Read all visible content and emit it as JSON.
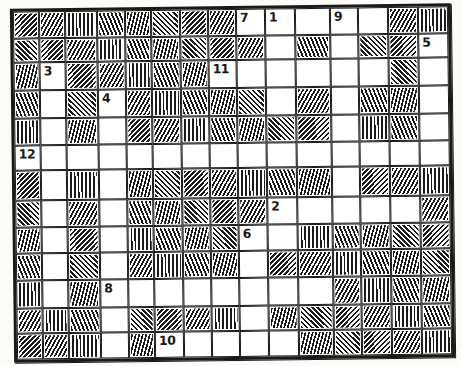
{
  "figure": {
    "type": "crossword-grid",
    "style": "hand-drawn-ink-sketch",
    "rows": 13,
    "cols": 15
  },
  "colors": {
    "ink": "#1a1a1a",
    "paper": "#ffffff"
  },
  "grid": {
    "pattern": [
      "########.....##",
      "#########.#.##.",
      "#.#####......#.",
      "#.#.#####.#.##.",
      "#.#.#######.##.",
      "...............",
      "#.#.#######.###",
      "#.#.#####.....#",
      "#.#.####..#####",
      "#.#.####.######",
      "#.#........####",
      "###.####.######",
      "###.#.....#####"
    ],
    "numbers": [
      {
        "label": "7",
        "row": 1,
        "col": 9
      },
      {
        "label": "1",
        "row": 1,
        "col": 10
      },
      {
        "label": "9",
        "row": 1,
        "col": 12
      },
      {
        "label": "5",
        "row": 2,
        "col": 15
      },
      {
        "label": "3",
        "row": 3,
        "col": 2
      },
      {
        "label": "11",
        "row": 3,
        "col": 8
      },
      {
        "label": "4",
        "row": 4,
        "col": 4
      },
      {
        "label": "12",
        "row": 6,
        "col": 1
      },
      {
        "label": "2",
        "row": 8,
        "col": 10
      },
      {
        "label": "6",
        "row": 9,
        "col": 9
      },
      {
        "label": "8",
        "row": 11,
        "col": 4
      },
      {
        "label": "10",
        "row": 13,
        "col": 6
      }
    ],
    "col_edges": [
      0,
      26,
      52,
      84,
      112,
      138,
      167,
      195,
      223,
      252,
      282,
      317,
      345,
      375,
      405,
      435
    ],
    "row_edges": [
      0,
      27,
      51,
      79,
      107,
      134,
      159,
      189,
      216,
      242,
      269,
      297,
      322,
      348
    ]
  }
}
